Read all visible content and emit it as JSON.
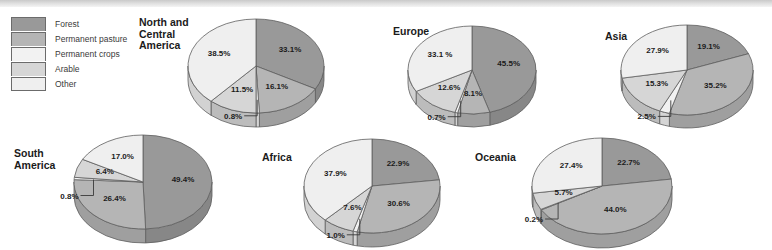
{
  "figure": {
    "legend": {
      "title": "",
      "items": [
        {
          "label": "Forest",
          "color": "#999999"
        },
        {
          "label": "Permanent pasture",
          "color": "#b5b5b5"
        },
        {
          "label": "Permanent crops",
          "color": "#f2f2f2"
        },
        {
          "label": "Arable",
          "color": "#d6d6d6"
        },
        {
          "label": "Other",
          "color": "#efefef"
        }
      ]
    }
  },
  "chart_data": {
    "type": "pie",
    "title": "",
    "legend_position": "top-left",
    "categories": [
      "Forest",
      "Permanent pasture",
      "Permanent crops",
      "Arable",
      "Other"
    ],
    "colors": [
      "#999999",
      "#b5b5b5",
      "#f2f2f2",
      "#d6d6d6",
      "#efefef"
    ],
    "unit": "%",
    "charts": [
      {
        "name": "north-central-america",
        "title": "North and\nCentral\nAmerica",
        "values": [
          33.1,
          16.1,
          0.8,
          11.5,
          38.5
        ],
        "labels": [
          "33.1%",
          "16.1%",
          "0.8%",
          "11.5%",
          "38.5%"
        ]
      },
      {
        "name": "europe",
        "title": "Europe",
        "values": [
          45.5,
          8.1,
          0.7,
          12.6,
          33.1
        ],
        "labels": [
          "45.5%",
          "8.1%",
          "0.7%",
          "12.6%",
          "33.1 %"
        ]
      },
      {
        "name": "asia",
        "title": "Asia",
        "values": [
          19.1,
          35.2,
          2.5,
          15.3,
          27.9
        ],
        "labels": [
          "19.1%",
          "35.2%",
          "2.5%",
          "15.3%",
          "27.9%"
        ]
      },
      {
        "name": "south-america",
        "title": "South\nAmerica",
        "values": [
          49.4,
          26.4,
          0.8,
          6.4,
          17.0
        ],
        "labels": [
          "49.4%",
          "26.4%",
          "0.8%",
          "6.4%",
          "17.0%"
        ]
      },
      {
        "name": "africa",
        "title": "Africa",
        "values": [
          22.9,
          30.6,
          1.0,
          7.6,
          37.9
        ],
        "labels": [
          "22.9%",
          "30.6%",
          "1.0%",
          "7.6%",
          "37.9%"
        ]
      },
      {
        "name": "oceania",
        "title": "Oceania",
        "values": [
          22.7,
          44.0,
          0.2,
          5.7,
          27.4
        ],
        "labels": [
          "22.7%",
          "44.0%",
          "0.2%",
          "5.7%",
          "27.4%"
        ]
      }
    ]
  },
  "layout": {
    "pies": [
      {
        "name": "north-central-america",
        "cx": 256,
        "cy": 66,
        "rx": 68,
        "ry": 47,
        "depth": 14,
        "title_x": 139,
        "title_y": 17,
        "title_align": "left"
      },
      {
        "name": "europe",
        "cx": 472,
        "cy": 70,
        "rx": 64,
        "ry": 44,
        "depth": 13,
        "title_x": 393,
        "title_y": 26,
        "title_align": "left"
      },
      {
        "name": "asia",
        "cx": 687,
        "cy": 70,
        "rx": 66,
        "ry": 45,
        "depth": 13,
        "title_x": 605,
        "title_y": 31,
        "title_align": "left"
      },
      {
        "name": "south-america",
        "cx": 143,
        "cy": 182,
        "rx": 69,
        "ry": 47,
        "depth": 14,
        "title_x": 14,
        "title_y": 148,
        "title_align": "left"
      },
      {
        "name": "africa",
        "cx": 372,
        "cy": 186,
        "rx": 68,
        "ry": 47,
        "depth": 14,
        "title_x": 262,
        "title_y": 152,
        "title_align": "left"
      },
      {
        "name": "oceania",
        "cx": 602,
        "cy": 186,
        "rx": 70,
        "ry": 48,
        "depth": 14,
        "title_x": 475,
        "title_y": 152,
        "title_align": "left"
      }
    ]
  }
}
